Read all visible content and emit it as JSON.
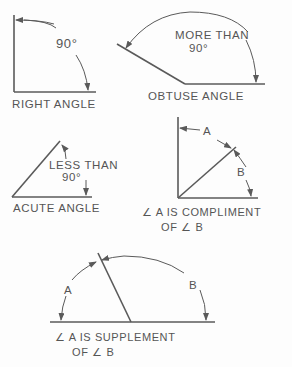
{
  "diagrams": {
    "right_angle": {
      "caption": "RIGHT ANGLE",
      "measure": "90°"
    },
    "obtuse_angle": {
      "caption": "OBTUSE ANGLE",
      "measure_line1": "MORE THAN",
      "measure_line2": "90°"
    },
    "acute_angle": {
      "caption": "ACUTE ANGLE",
      "measure_line1": "LESS THAN",
      "measure_line2": "90°"
    },
    "complement": {
      "label_a": "A",
      "label_b": "B",
      "caption_line1": "∠ A IS COMPLIMENT",
      "caption_line2": "OF ∠ B"
    },
    "supplement": {
      "label_a": "A",
      "label_b": "B",
      "caption_line1": "∠ A IS SUPPLEMENT",
      "caption_line2": "OF ∠ B"
    }
  },
  "colors": {
    "line": "#5a5a5a",
    "text": "#555555",
    "background": "#fdfdfd"
  }
}
